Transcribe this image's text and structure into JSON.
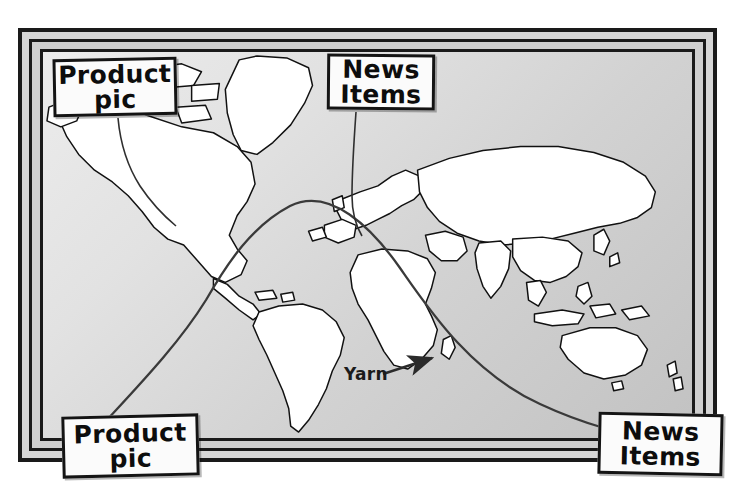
{
  "scene": {
    "title": "World map bulletin board with yarn-connected notes",
    "board_color": "#d6d6d6",
    "frame_color": "#1a1a1a",
    "land_color": "#ffffff",
    "ocean_color": "#d2d2d2",
    "yarn_color": "#3a3a3a"
  },
  "notes": [
    {
      "id": "note-top-left",
      "line1": "Product",
      "line2": "pic",
      "position": "top-left"
    },
    {
      "id": "note-top-right",
      "line1": "News",
      "line2": "Items",
      "position": "top-right"
    },
    {
      "id": "note-bottom-left",
      "line1": "Product",
      "line2": "pic",
      "position": "bottom-left"
    },
    {
      "id": "note-bottom-right",
      "line1": "News",
      "line2": "Items",
      "position": "bottom-right"
    }
  ],
  "annotations": {
    "yarn_label": "Yarn"
  }
}
